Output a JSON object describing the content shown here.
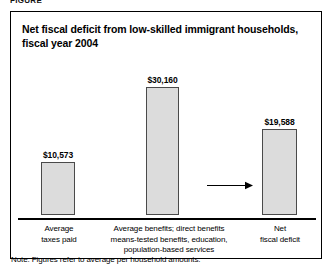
{
  "figure_caption_clipped": "FIGURE",
  "chart_note": "Note: Figures refer to average per household amounts.",
  "arrow": {
    "name": "flow-arrow",
    "direction": "right"
  },
  "chart_data": {
    "type": "bar",
    "title": "Net fiscal deficit from low-skilled immigrant households, fiscal year 2004",
    "xlabel": "",
    "ylabel": "",
    "ylim": [
      0,
      33000
    ],
    "grid": false,
    "legend": "none",
    "categories": [
      "Average\ntaxes paid",
      "Average benefits; direct benefits\nmeans-tested benefits, education,\npopulation-based services",
      "Net\nfiscal deficit"
    ],
    "category_labels": [
      "Average taxes paid",
      "Average benefits; direct benefits means-tested benefits, education, population-based services",
      "Net fiscal deficit"
    ],
    "values": [
      10573,
      30160,
      19588
    ],
    "data_labels": [
      "$10,573",
      "$30,160",
      "$19,588"
    ],
    "annotations": [
      {
        "type": "arrow",
        "from_category": "Average benefits; direct benefits means-tested benefits, education, population-based services",
        "to_category": "Net fiscal deficit",
        "text": ""
      }
    ],
    "note": "Note: Figures refer to average per household amounts.",
    "colors": {
      "bar_fill": "#dcdcdc",
      "bar_stroke": "#4a4a4a",
      "axis": "#000000",
      "text": "#000000",
      "background": "#ffffff"
    }
  }
}
